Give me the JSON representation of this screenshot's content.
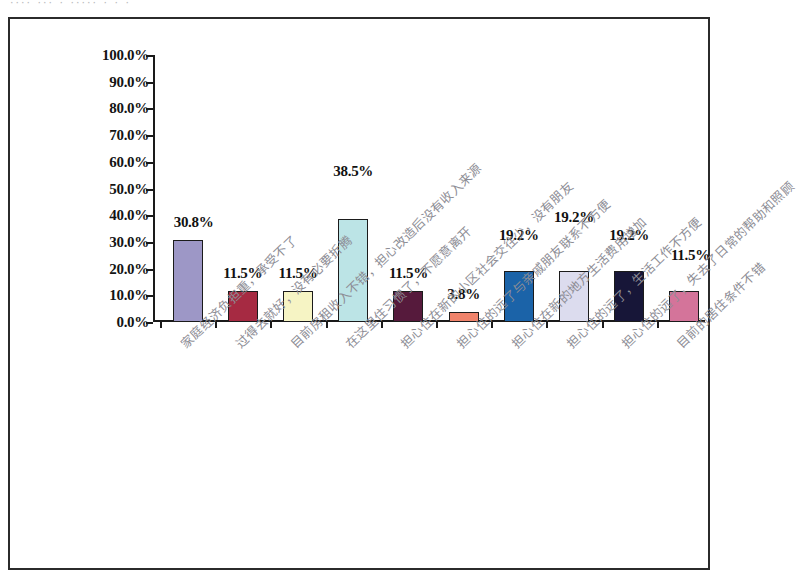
{
  "scan": {
    "clipped_header_text": "···· ··· ·  ····· · · ·"
  },
  "chart_data": {
    "type": "bar",
    "title": "",
    "xlabel": "",
    "ylabel": "",
    "ylim": [
      0,
      100
    ],
    "ytick_labels": [
      "100.0%",
      "90.0%",
      "80.0%",
      "70.0%",
      "60.0%",
      "50.0%",
      "40.0%",
      "30.0%",
      "20.0%",
      "10.0%",
      "0.0%"
    ],
    "ytick_values": [
      100,
      90,
      80,
      70,
      60,
      50,
      40,
      30,
      20,
      10,
      0
    ],
    "grid": false,
    "legend": "none",
    "value_suffix": "%",
    "categories": [
      "家庭经济负担重，承受不了",
      "过得去就好，没有必要折腾",
      "目前房租收入不错，担心改造后没有收入来源",
      "在这里住习惯了，不愿意离开",
      "担心住在新的小区社会交往少，没有朋友",
      "担心住的远了与亲戚朋友联系不方便",
      "担心住在新的地方生活费用增加",
      "担心住的远了，生活工作不方便",
      "担心住的远了，失去了日常的帮助和照顾",
      "目前的居住条件不错"
    ],
    "values": [
      30.8,
      11.5,
      11.5,
      38.5,
      11.5,
      3.8,
      19.2,
      19.2,
      19.2,
      11.5
    ],
    "value_labels": [
      "30.8%",
      "11.5%",
      "11.5%",
      "38.5%",
      "11.5%",
      "3.8%",
      "19.2%",
      "19.2%",
      "19.2%",
      "11.5%"
    ],
    "bar_colors": [
      "#9d97c6",
      "#a62a42",
      "#f6f4c4",
      "#bce4e6",
      "#561a3c",
      "#f0836b",
      "#1b63a8",
      "#dcdcee",
      "#171638",
      "#d4749a"
    ],
    "bar_border_color": "#1b1b1b",
    "axis_color": "#1a1a1a",
    "frame_color": "#2b2b2b",
    "background": "#ffffff"
  }
}
